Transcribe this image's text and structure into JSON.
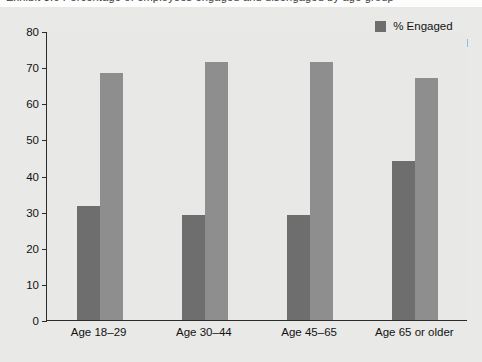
{
  "title_sliver": "Exhibit 3.6  Percentage of employees engaged and disengaged by age group",
  "legend": {
    "position": "top-right",
    "items": [
      {
        "label": "% Engaged",
        "color": "#6e6e6e",
        "swatch_name": "legend-swatch-engaged"
      },
      {
        "label": "% Disengaged",
        "color": "#8e8e8e",
        "swatch_name": "legend-swatch-disengaged"
      }
    ]
  },
  "axis": {
    "y_ticks": [
      "0",
      "10",
      "20",
      "30",
      "40",
      "50",
      "60",
      "70",
      "80"
    ],
    "x_labels": [
      "Age 18–29",
      "Age 30–44",
      "Age 45–65",
      "Age 65 or older"
    ]
  },
  "chart_data": {
    "type": "bar",
    "title": "",
    "xlabel": "",
    "ylabel": "",
    "ylim": [
      0,
      80
    ],
    "ytick_step": 10,
    "grid": false,
    "legend_position": "top-right",
    "categories": [
      "Age 18–29",
      "Age 30–44",
      "Age 45–65",
      "Age 65 or older"
    ],
    "series": [
      {
        "name": "% Engaged",
        "color": "#6e6e6e",
        "values": [
          31.6,
          29.0,
          29.0,
          44.0
        ]
      },
      {
        "name": "% Disengaged",
        "color": "#8e8e8e",
        "values": [
          68.3,
          71.5,
          71.5,
          67.0
        ]
      }
    ]
  },
  "colors": {
    "engaged": "#6e6e6e",
    "disengaged": "#8e8e8e",
    "plot_background": "#e8e8e6",
    "page_background": "#e9e9e7",
    "axis": "#2b2b2b"
  }
}
